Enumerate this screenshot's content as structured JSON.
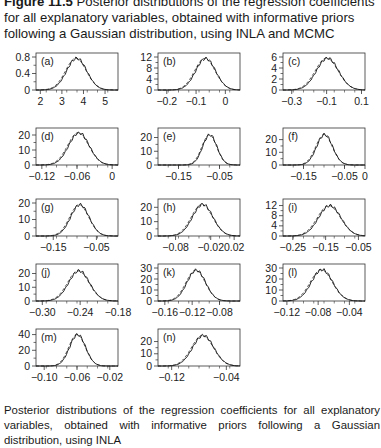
{
  "figure": {
    "title_bold": "Figure 11.5",
    "title_rest": " Posterior distributions of the regression coefficients for all explanatory variables, obtained with informative priors following a Gaussian distribution, using INLA and MCMC",
    "bottom_caption": "Posterior distributions of the regression coefficients for all explanatory variables, obtained with informative priors following a Gaussian distribution, using INLA"
  },
  "chart_data": [
    {
      "type": "line",
      "label": "(a)",
      "x_ticks": [
        "2",
        "3",
        "4",
        "5"
      ],
      "x_range": [
        1.8,
        5.6
      ],
      "y_ticks": [
        "0",
        "0.4",
        "0.8"
      ],
      "y_range": [
        0,
        0.8
      ],
      "peak_x": 3.65,
      "peak_y": 0.77,
      "sd": 0.48,
      "series": [
        {
          "name": "INLA",
          "style": "dashed"
        },
        {
          "name": "MCMC",
          "style": "solid"
        }
      ]
    },
    {
      "type": "line",
      "label": "(b)",
      "x_ticks": [
        "−0.2",
        "−0.1",
        "0"
      ],
      "x_range": [
        -0.23,
        0.05
      ],
      "y_ticks": [
        "0",
        "4",
        "8",
        "12"
      ],
      "y_range": [
        0,
        12
      ],
      "peak_x": -0.07,
      "peak_y": 11.5,
      "sd": 0.035,
      "series": [
        {
          "name": "INLA",
          "style": "dashed"
        },
        {
          "name": "MCMC",
          "style": "solid"
        }
      ]
    },
    {
      "type": "line",
      "label": "(c)",
      "x_ticks": [
        "−0.3",
        "−0.1",
        "0.1"
      ],
      "x_range": [
        -0.35,
        0.12
      ],
      "y_ticks": [
        "0",
        "2",
        "4",
        "6"
      ],
      "y_range": [
        0,
        6
      ],
      "peak_x": -0.1,
      "peak_y": 5.8,
      "sd": 0.065,
      "series": [
        {
          "name": "INLA",
          "style": "dashed"
        },
        {
          "name": "MCMC",
          "style": "solid"
        }
      ]
    },
    {
      "type": "line",
      "label": "(d)",
      "x_ticks": [
        "−0.12",
        "−0.06",
        "0"
      ],
      "x_range": [
        -0.13,
        0.01
      ],
      "y_ticks": [
        "0",
        "10",
        "20"
      ],
      "y_range": [
        0,
        22
      ],
      "peak_x": -0.058,
      "peak_y": 21.5,
      "sd": 0.018,
      "series": [
        {
          "name": "INLA",
          "style": "dashed"
        },
        {
          "name": "MCMC",
          "style": "solid"
        }
      ]
    },
    {
      "type": "line",
      "label": "(e)",
      "x_ticks": [
        "−0.15",
        "−0.05"
      ],
      "x_range": [
        -0.2,
        0.0
      ],
      "y_ticks": [
        "0",
        "10",
        "20"
      ],
      "y_range": [
        0,
        24
      ],
      "peak_x": -0.075,
      "peak_y": 22,
      "sd": 0.018,
      "series": [
        {
          "name": "INLA",
          "style": "dashed"
        },
        {
          "name": "MCMC",
          "style": "solid"
        }
      ]
    },
    {
      "type": "line",
      "label": "(f)",
      "x_ticks": [
        "−0.15",
        "−0.05",
        "0"
      ],
      "x_range": [
        -0.2,
        0.0
      ],
      "y_ticks": [
        "0",
        "10",
        "20"
      ],
      "y_range": [
        0,
        26
      ],
      "peak_x": -0.1,
      "peak_y": 24,
      "sd": 0.02,
      "series": [
        {
          "name": "INLA",
          "style": "dashed"
        },
        {
          "name": "MCMC",
          "style": "solid"
        }
      ]
    },
    {
      "type": "line",
      "label": "(g)",
      "x_ticks": [
        "−0.15",
        "−0.05"
      ],
      "x_range": [
        -0.19,
        0.0
      ],
      "y_ticks": [
        "0",
        "10",
        "20"
      ],
      "y_range": [
        0,
        20
      ],
      "peak_x": -0.09,
      "peak_y": 19,
      "sd": 0.022,
      "series": [
        {
          "name": "INLA",
          "style": "dashed"
        },
        {
          "name": "MCMC",
          "style": "solid"
        }
      ]
    },
    {
      "type": "line",
      "label": "(h)",
      "x_ticks": [
        "−0.08",
        "−0.02",
        "0.02"
      ],
      "x_range": [
        -0.11,
        0.03
      ],
      "y_ticks": [
        "0",
        "10",
        "20"
      ],
      "y_range": [
        0,
        23
      ],
      "peak_x": -0.035,
      "peak_y": 22,
      "sd": 0.018,
      "series": [
        {
          "name": "INLA",
          "style": "dashed"
        },
        {
          "name": "MCMC",
          "style": "solid"
        }
      ]
    },
    {
      "type": "line",
      "label": "(i)",
      "x_ticks": [
        "−0.25",
        "−0.15",
        "−0.05"
      ],
      "x_range": [
        -0.28,
        -0.03
      ],
      "y_ticks": [
        "0",
        "4",
        "8",
        "12"
      ],
      "y_range": [
        0,
        13
      ],
      "peak_x": -0.14,
      "peak_y": 12,
      "sd": 0.035,
      "series": [
        {
          "name": "INLA",
          "style": "dashed"
        },
        {
          "name": "MCMC",
          "style": "solid"
        }
      ]
    },
    {
      "type": "line",
      "label": "(j)",
      "x_ticks": [
        "−0.30",
        "−0.24",
        "−0.18"
      ],
      "x_range": [
        -0.31,
        -0.18
      ],
      "y_ticks": [
        "0",
        "10",
        "20"
      ],
      "y_range": [
        0,
        24
      ],
      "peak_x": -0.243,
      "peak_y": 22,
      "sd": 0.017,
      "series": [
        {
          "name": "INLA",
          "style": "dashed"
        },
        {
          "name": "MCMC",
          "style": "solid"
        }
      ]
    },
    {
      "type": "line",
      "label": "(k)",
      "x_ticks": [
        "−0.16",
        "−0.12",
        "−0.08"
      ],
      "x_range": [
        -0.17,
        -0.05
      ],
      "y_ticks": [
        "0",
        "10",
        "20",
        "30"
      ],
      "y_range": [
        0,
        30
      ],
      "peak_x": -0.115,
      "peak_y": 28,
      "sd": 0.014,
      "series": [
        {
          "name": "INLA",
          "style": "dashed"
        },
        {
          "name": "MCMC",
          "style": "solid"
        }
      ]
    },
    {
      "type": "line",
      "label": "(l)",
      "x_ticks": [
        "−0.12",
        "−0.08",
        "−0.04"
      ],
      "x_range": [
        -0.125,
        -0.02
      ],
      "y_ticks": [
        "0",
        "10",
        "20",
        "30"
      ],
      "y_range": [
        0,
        30
      ],
      "peak_x": -0.076,
      "peak_y": 28.5,
      "sd": 0.014,
      "series": [
        {
          "name": "INLA",
          "style": "dashed"
        },
        {
          "name": "MCMC",
          "style": "solid"
        }
      ]
    },
    {
      "type": "line",
      "label": "(m)",
      "x_ticks": [
        "−0.10",
        "−0.06",
        "−0.02"
      ],
      "x_range": [
        -0.11,
        -0.01
      ],
      "y_ticks": [
        "0",
        "20",
        "40"
      ],
      "y_range": [
        0,
        42
      ],
      "peak_x": -0.06,
      "peak_y": 40,
      "sd": 0.01,
      "series": [
        {
          "name": "INLA",
          "style": "dashed"
        },
        {
          "name": "MCMC",
          "style": "solid"
        }
      ]
    },
    {
      "type": "line",
      "label": "(n)",
      "x_ticks": [
        "−0.12",
        "−0.04"
      ],
      "x_range": [
        -0.14,
        -0.02
      ],
      "y_ticks": [
        "0",
        "10",
        "20"
      ],
      "y_range": [
        0,
        27
      ],
      "peak_x": -0.075,
      "peak_y": 25,
      "sd": 0.016,
      "series": [
        {
          "name": "INLA",
          "style": "dashed"
        },
        {
          "name": "MCMC",
          "style": "solid"
        }
      ]
    }
  ]
}
